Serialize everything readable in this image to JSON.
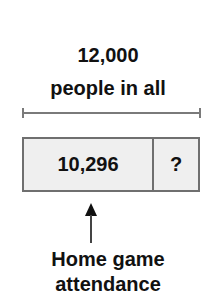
{
  "title": {
    "line1": "12,000",
    "line2": "people in all"
  },
  "bar": {
    "known_value": "10,296",
    "unknown_value": "?"
  },
  "pointer_label": {
    "line1": "Home game",
    "line2": "attendance"
  },
  "colors": {
    "box_fill": "#efefef",
    "box_border": "#6f6f6f",
    "bracket": "#7a7a7a",
    "text": "#111111"
  }
}
